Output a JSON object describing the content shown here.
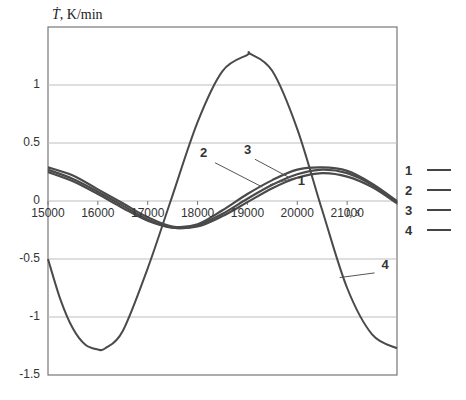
{
  "chart_data": {
    "type": "line",
    "title": "",
    "ylabel": "Ṫ, K/min",
    "ylabel_symbol": "Ṫ",
    "ylabel_unit": ", K/min",
    "xlabel": "t, s",
    "xlim": [
      15000,
      22000
    ],
    "ylim": [
      -1.5,
      1.5
    ],
    "y_ticks": [
      1,
      0.5,
      0,
      -0.5,
      -1,
      -1.5
    ],
    "y_tick_labels": [
      "1",
      "0.5",
      "0",
      "-0.5",
      "-1",
      "-1.5"
    ],
    "x_ticks": [
      15000,
      16000,
      17000,
      18000,
      19000,
      20000,
      21000
    ],
    "x_tick_labels": [
      "15000",
      "16000",
      "17000",
      "18000",
      "19000",
      "20000",
      "21000"
    ],
    "grid": "horizontal",
    "legend_position": "right",
    "legend": [
      "1",
      "2",
      "3",
      "4"
    ],
    "series": [
      {
        "name": "1",
        "x": [
          15000,
          15500,
          16000,
          16500,
          17000,
          17500,
          18000,
          18500,
          19000,
          19500,
          20000,
          20500,
          21000,
          21500,
          22000
        ],
        "values": [
          0.25,
          0.17,
          0.06,
          -0.06,
          -0.17,
          -0.23,
          -0.22,
          -0.13,
          -0.01,
          0.11,
          0.2,
          0.24,
          0.21,
          0.12,
          -0.02
        ]
      },
      {
        "name": "2",
        "x": [
          15000,
          15500,
          16000,
          16500,
          17000,
          17500,
          18000,
          18500,
          19000,
          19500,
          20000,
          20500,
          21000,
          21500,
          22000
        ],
        "values": [
          0.27,
          0.19,
          0.08,
          -0.04,
          -0.16,
          -0.23,
          -0.21,
          -0.11,
          0.02,
          0.14,
          0.23,
          0.27,
          0.24,
          0.14,
          -0.01
        ]
      },
      {
        "name": "3",
        "x": [
          15000,
          15500,
          16000,
          16500,
          17000,
          17500,
          18000,
          18500,
          19000,
          19500,
          20000,
          20500,
          21000,
          21500,
          22000
        ],
        "values": [
          0.29,
          0.22,
          0.1,
          -0.02,
          -0.14,
          -0.22,
          -0.2,
          -0.08,
          0.06,
          0.18,
          0.27,
          0.29,
          0.26,
          0.15,
          0.0
        ]
      },
      {
        "name": "4",
        "x": [
          15000,
          15250,
          15500,
          15750,
          16000,
          16150,
          16500,
          17000,
          17460,
          18000,
          18500,
          19000,
          19050,
          19500,
          20000,
          20500,
          21000,
          21500,
          22000
        ],
        "values": [
          -0.5,
          -0.85,
          -1.1,
          -1.24,
          -1.28,
          -1.27,
          -1.12,
          -0.58,
          0.0,
          0.68,
          1.12,
          1.26,
          1.27,
          1.12,
          0.62,
          -0.08,
          -0.75,
          -1.15,
          -1.27
        ]
      }
    ],
    "annotations": [
      {
        "label": "1",
        "x": 20050,
        "y": 0.21
      },
      {
        "label": "2",
        "x": 18250,
        "y": 0.36
      },
      {
        "label": "3",
        "x": 19050,
        "y": 0.39
      },
      {
        "label": "4",
        "x": 21650,
        "y": -0.6
      }
    ],
    "colors": {
      "series": "#4a4a4a",
      "grid": "#bdbdbd",
      "axis": "#777777"
    }
  }
}
